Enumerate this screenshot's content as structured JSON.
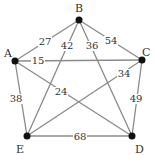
{
  "diagram": {
    "type": "weighted-complete-graph",
    "nodes": [
      {
        "id": "A",
        "label": "A",
        "x": 15,
        "y": 61,
        "lx": 4,
        "ly": 57
      },
      {
        "id": "B",
        "label": "B",
        "x": 79,
        "y": 20,
        "lx": 75,
        "ly": 12
      },
      {
        "id": "C",
        "label": "C",
        "x": 142,
        "y": 60,
        "lx": 142,
        "ly": 56
      },
      {
        "id": "D",
        "label": "D",
        "x": 132,
        "y": 136,
        "lx": 135,
        "ly": 153
      },
      {
        "id": "E",
        "label": "E",
        "x": 27,
        "y": 136,
        "lx": 16,
        "ly": 153
      }
    ],
    "edges": [
      {
        "from": "A",
        "to": "B",
        "weight": "27",
        "lx": 45,
        "ly": 45
      },
      {
        "from": "B",
        "to": "C",
        "weight": "54",
        "lx": 111,
        "ly": 44
      },
      {
        "from": "A",
        "to": "C",
        "weight": "15",
        "lx": 38,
        "ly": 64
      },
      {
        "from": "B",
        "to": "E",
        "weight": "42",
        "lx": 67,
        "ly": 49
      },
      {
        "from": "B",
        "to": "D",
        "weight": "36",
        "lx": 92,
        "ly": 49
      },
      {
        "from": "C",
        "to": "E",
        "weight": "34",
        "lx": 124,
        "ly": 77
      },
      {
        "from": "A",
        "to": "D",
        "weight": "24",
        "lx": 61,
        "ly": 95
      },
      {
        "from": "A",
        "to": "E",
        "weight": "38",
        "lx": 16,
        "ly": 102
      },
      {
        "from": "C",
        "to": "D",
        "weight": "49",
        "lx": 136,
        "ly": 102
      },
      {
        "from": "E",
        "to": "D",
        "weight": "68",
        "lx": 80,
        "ly": 140
      }
    ]
  }
}
